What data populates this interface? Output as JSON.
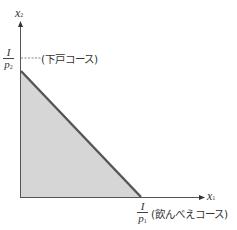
{
  "diagram": {
    "type": "budget-constraint",
    "y_axis": {
      "label": "x",
      "subscript": "2"
    },
    "x_axis": {
      "label": "x",
      "subscript": "1"
    },
    "y_intercept": {
      "numerator": "I",
      "denominator": "p",
      "denominator_sub": "2",
      "annotation": "(下戸コース)"
    },
    "x_intercept": {
      "numerator": "I",
      "denominator": "p",
      "denominator_sub": "1",
      "annotation": "(飲んべえコース)"
    },
    "colors": {
      "axis": "#555555",
      "budget_line": "#555555",
      "shaded_region": "#d6d6d6",
      "dashed_line": "#666666"
    }
  }
}
